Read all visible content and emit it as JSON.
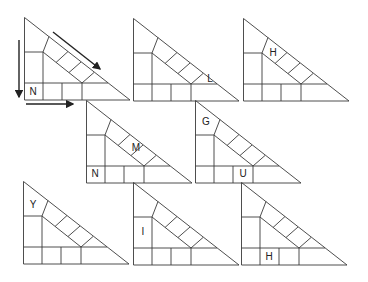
{
  "diagram": {
    "stroke_color": "#3a3a3a",
    "arrow_color": "#222222",
    "triangles": [
      {
        "id": 1,
        "x": 24,
        "y": 17,
        "labels": [
          {
            "text": "N",
            "cell": "bottom-1",
            "x": 9,
            "y": 75
          }
        ]
      },
      {
        "id": 2,
        "x": 133,
        "y": 18,
        "labels": [
          {
            "text": "L",
            "cell": "diagonal-end",
            "x": 77,
            "y": 61
          }
        ]
      },
      {
        "id": 3,
        "x": 243,
        "y": 18,
        "labels": [
          {
            "text": "H",
            "cell": "diagonal-1",
            "x": 30,
            "y": 35
          }
        ]
      },
      {
        "id": 4,
        "x": 86,
        "y": 100,
        "labels": [
          {
            "text": "M",
            "cell": "diagonal-2",
            "x": 50,
            "y": 48
          },
          {
            "text": "N",
            "cell": "bottom-1",
            "x": 9,
            "y": 74
          }
        ]
      },
      {
        "id": 5,
        "x": 195,
        "y": 100,
        "labels": [
          {
            "text": "G",
            "cell": "top-left",
            "x": 11,
            "y": 22
          },
          {
            "text": "U",
            "cell": "bottom-3",
            "x": 48,
            "y": 74
          }
        ]
      },
      {
        "id": 6,
        "x": 23,
        "y": 181,
        "labels": [
          {
            "text": "Y",
            "cell": "top-left",
            "x": 10,
            "y": 24
          }
        ]
      },
      {
        "id": 7,
        "x": 133,
        "y": 182,
        "labels": [
          {
            "text": "I",
            "cell": "left-column",
            "x": 10,
            "y": 50
          }
        ]
      },
      {
        "id": 8,
        "x": 241,
        "y": 182,
        "labels": [
          {
            "text": "H",
            "cell": "bottom-2",
            "x": 28,
            "y": 75
          }
        ]
      }
    ],
    "arrows": [
      {
        "name": "down-arrow",
        "direction": "down",
        "from": [
          19,
          40
        ],
        "to": [
          19,
          97
        ]
      },
      {
        "name": "right-arrow",
        "direction": "right",
        "from": [
          26,
          104
        ],
        "to": [
          73,
          104
        ]
      },
      {
        "name": "diagonal-arrow",
        "direction": "down-right",
        "from": [
          53,
          32
        ],
        "to": [
          100,
          69
        ]
      }
    ]
  }
}
